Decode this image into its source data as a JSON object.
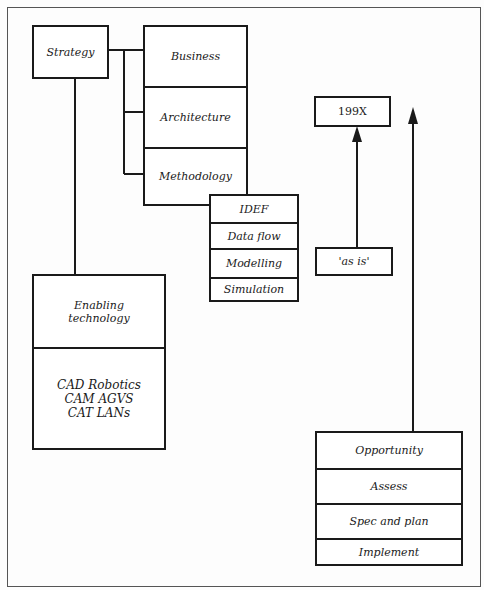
{
  "diagram": {
    "strategy": "Strategy",
    "strategy_areas": [
      "Business",
      "Architecture",
      "Methodology"
    ],
    "methods": [
      "IDEF",
      "Data flow",
      "Modelling",
      "Simulation"
    ],
    "enabling": {
      "title_line1": "Enabling",
      "title_line2": "technology",
      "items_line1": "CAD Robotics",
      "items_line2": "CAM AGVS",
      "items_line3": "CAT LANs"
    },
    "target_state": "199X",
    "current_state": "'as is'",
    "process_steps": [
      "Opportunity",
      "Assess",
      "Spec and plan",
      "Implement"
    ]
  }
}
